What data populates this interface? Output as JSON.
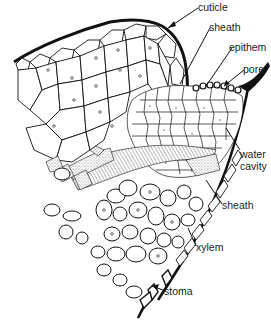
{
  "diagram": {
    "type": "botanical cross-section",
    "colors": {
      "ink": "#111111",
      "background": "#ffffff",
      "stipple": "#8a8a8a"
    },
    "labels": [
      {
        "id": "cuticle",
        "text": "cuticle",
        "x": 198,
        "y": 2
      },
      {
        "id": "sheath_top",
        "text": "sheath",
        "x": 209,
        "y": 22
      },
      {
        "id": "epithem",
        "text": "epithem",
        "x": 229,
        "y": 42
      },
      {
        "id": "pore",
        "text": "pore",
        "x": 243,
        "y": 64
      },
      {
        "id": "water_cavity_1",
        "text": "water",
        "x": 240,
        "y": 149
      },
      {
        "id": "water_cavity_2",
        "text": "cavity",
        "x": 240,
        "y": 161
      },
      {
        "id": "sheath_bottom",
        "text": "sheath",
        "x": 222,
        "y": 200
      },
      {
        "id": "xylem",
        "text": "xylem",
        "x": 196,
        "y": 242
      },
      {
        "id": "stoma",
        "text": "stoma",
        "x": 164,
        "y": 286
      }
    ]
  }
}
